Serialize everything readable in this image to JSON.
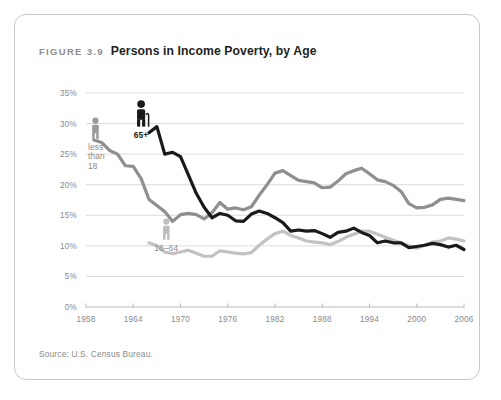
{
  "figure": {
    "number": "FIGURE 3.9",
    "title": "Persons in Income Poverty, by Age",
    "source": "Source: U.S. Census Bureau."
  },
  "colors": {
    "under18": "#8f8f8f",
    "age65plus": "#1a1a1a",
    "age18to64": "#c2c2c2",
    "grid": "#d8d8d8",
    "axis": "#b4b4b4",
    "label": "#8a8a8a",
    "title": "#231f20",
    "figure_number": "#8e8e8e",
    "card_border": "#c9c9c9",
    "background": "#ffffff"
  },
  "annotations": [
    {
      "name": "less-than-18",
      "label_lines": [
        "less",
        "than",
        "18"
      ],
      "icon": "person-child-icon",
      "color": "#9a9a9a",
      "x": 1959.2,
      "y_pct": 27.5,
      "bold": false
    },
    {
      "name": "65-plus",
      "label_lines": [
        "65+"
      ],
      "icon": "person-elderly-cane-icon",
      "color": "#1a1a1a",
      "x": 1965.0,
      "y_pct": 29.5,
      "bold": true
    },
    {
      "name": "18-64",
      "label_lines": [
        "18–64"
      ],
      "icon": "person-adult-icon",
      "color": "#bdbdbd",
      "x": 1968.2,
      "y_pct": 11.0,
      "bold": false
    }
  ],
  "chart_data": {
    "type": "line",
    "title": "Persons in Income Poverty, by Age",
    "xlabel": "",
    "ylabel": "",
    "xlim": [
      1958,
      2006
    ],
    "ylim": [
      0,
      35
    ],
    "ytick_labels": [
      "0%",
      "5%",
      "10%",
      "15%",
      "20%",
      "25%",
      "30%",
      "35%"
    ],
    "ytick_values": [
      0,
      5,
      10,
      15,
      20,
      25,
      30,
      35
    ],
    "xtick_labels": [
      "1958",
      "1964",
      "1970",
      "1976",
      "1982",
      "1988",
      "1994",
      "2000",
      "2006"
    ],
    "xtick_values": [
      1958,
      1964,
      1970,
      1976,
      1982,
      1988,
      1994,
      2000,
      2006
    ],
    "grid": "horizontal",
    "legend_position": "inline-annotations",
    "series": [
      {
        "name": "less than 18",
        "color": "#8f8f8f",
        "width": 3.2,
        "x": [
          1959,
          1960,
          1961,
          1962,
          1963,
          1964,
          1965,
          1966,
          1967,
          1968,
          1969,
          1970,
          1971,
          1972,
          1973,
          1974,
          1975,
          1976,
          1977,
          1978,
          1979,
          1980,
          1981,
          1982,
          1983,
          1984,
          1985,
          1986,
          1987,
          1988,
          1989,
          1990,
          1991,
          1992,
          1993,
          1994,
          1995,
          1996,
          1997,
          1998,
          1999,
          2000,
          2001,
          2002,
          2003,
          2004,
          2005,
          2006
        ],
        "values": [
          27.3,
          26.9,
          25.6,
          25.0,
          23.1,
          23.0,
          21.0,
          17.6,
          16.6,
          15.6,
          14.0,
          15.1,
          15.3,
          15.1,
          14.4,
          15.4,
          17.1,
          16.0,
          16.2,
          15.9,
          16.4,
          18.3,
          20.0,
          21.9,
          22.3,
          21.5,
          20.7,
          20.5,
          20.3,
          19.5,
          19.6,
          20.6,
          21.8,
          22.3,
          22.7,
          21.8,
          20.8,
          20.5,
          19.9,
          18.9,
          16.9,
          16.2,
          16.3,
          16.7,
          17.6,
          17.8,
          17.6,
          17.4
        ]
      },
      {
        "name": "65+",
        "color": "#1a1a1a",
        "width": 3.2,
        "x": [
          1966,
          1967,
          1968,
          1969,
          1970,
          1971,
          1972,
          1973,
          1974,
          1975,
          1976,
          1977,
          1978,
          1979,
          1980,
          1981,
          1982,
          1983,
          1984,
          1985,
          1986,
          1987,
          1988,
          1989,
          1990,
          1991,
          1992,
          1993,
          1994,
          1995,
          1996,
          1997,
          1998,
          1999,
          2000,
          2001,
          2002,
          2003,
          2004,
          2005,
          2006
        ],
        "values": [
          28.5,
          29.5,
          25.0,
          25.3,
          24.6,
          21.6,
          18.6,
          16.3,
          14.6,
          15.3,
          15.0,
          14.1,
          14.0,
          15.2,
          15.7,
          15.3,
          14.6,
          13.8,
          12.4,
          12.6,
          12.4,
          12.5,
          12.0,
          11.4,
          12.2,
          12.4,
          12.9,
          12.2,
          11.7,
          10.5,
          10.8,
          10.5,
          10.5,
          9.7,
          9.9,
          10.1,
          10.4,
          10.2,
          9.8,
          10.1,
          9.4
        ]
      },
      {
        "name": "18–64",
        "color": "#c2c2c2",
        "width": 3.2,
        "x": [
          1966,
          1967,
          1968,
          1969,
          1970,
          1971,
          1972,
          1973,
          1974,
          1975,
          1976,
          1977,
          1978,
          1979,
          1980,
          1981,
          1982,
          1983,
          1984,
          1985,
          1986,
          1987,
          1988,
          1989,
          1990,
          1991,
          1992,
          1993,
          1994,
          1995,
          1996,
          1997,
          1998,
          1999,
          2000,
          2001,
          2002,
          2003,
          2004,
          2005,
          2006
        ],
        "values": [
          10.5,
          10.0,
          9.0,
          8.7,
          9.0,
          9.3,
          8.8,
          8.3,
          8.3,
          9.2,
          9.0,
          8.8,
          8.7,
          8.9,
          10.1,
          11.1,
          12.0,
          12.4,
          11.7,
          11.3,
          10.8,
          10.6,
          10.5,
          10.2,
          10.7,
          11.4,
          11.9,
          12.4,
          12.4,
          11.9,
          11.4,
          10.9,
          10.5,
          10.0,
          9.6,
          10.1,
          10.6,
          10.8,
          11.3,
          11.1,
          10.8
        ]
      }
    ]
  }
}
